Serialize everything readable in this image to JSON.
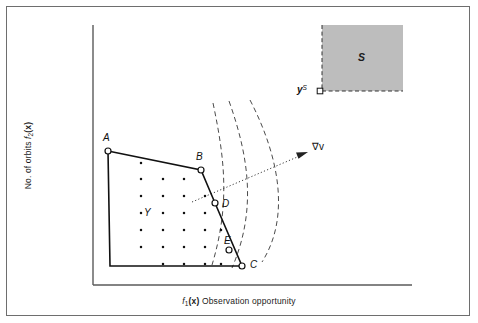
{
  "figure": {
    "type": "diagram",
    "kind": "multi-objective-feasible-region-schematic",
    "axes": {
      "x_label_prefix": "f",
      "x_label_sub": "1",
      "x_label_arg": "(x)",
      "x_label_text": "Observation opportunity",
      "y_label_text": "No. of orbits",
      "y_label_prefix": "f",
      "y_label_sub": "2",
      "y_label_arg": "(x)"
    },
    "labels": {
      "A": "A",
      "B": "B",
      "C": "C",
      "D": "D",
      "E": "E",
      "Y": "Y",
      "S": "S",
      "yS_base": "y",
      "yS_sup": "S",
      "gradient": "∇v"
    },
    "colors": {
      "frame": "#6e6e6e",
      "axis": "#5a5a5a",
      "polygon_edge": "#111111",
      "lattice_dot": "#111111",
      "contour_dashed": "#4b4b4b",
      "arrow_dotted": "#3d3d3d",
      "s_region_fill": "#bdbdbd",
      "s_region_border": "#333333",
      "marker_fill": "#ffffff",
      "background": "#ffffff"
    },
    "geometry": {
      "axis_origin": [
        93,
        285
      ],
      "axis_x_end": [
        412,
        285
      ],
      "axis_y_top": [
        93,
        25
      ],
      "polygon_vertices": {
        "A": [
          108,
          151
        ],
        "B": [
          201,
          170
        ],
        "D": [
          215,
          203
        ],
        "C": [
          242,
          266
        ],
        "origin_corner": [
          110,
          266
        ]
      },
      "markers": {
        "A": [
          108,
          151
        ],
        "B": [
          201,
          170
        ],
        "D": [
          215,
          203
        ],
        "E": [
          229,
          250
        ],
        "C": [
          242,
          266
        ],
        "yS": [
          320,
          91
        ]
      },
      "s_region": {
        "x": 322,
        "y": 25,
        "w": 81,
        "h": 66
      },
      "lattice_rows": 7,
      "lattice_cols": 6,
      "contours": 3,
      "gradient_arrow": {
        "from": [
          192,
          202
        ],
        "to": [
          310,
          152
        ]
      }
    }
  }
}
